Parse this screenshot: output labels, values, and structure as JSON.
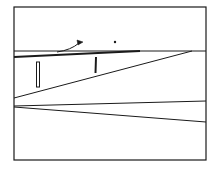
{
  "diagram": {
    "stroke_color": "#1a1a1a",
    "background": "#ffffff",
    "frame": {
      "x1": 14,
      "y1": 7,
      "x2": 206,
      "y2": 160
    },
    "lines": [
      {
        "name": "horizontal-reference-line",
        "x1": 14,
        "y1": 51,
        "x2": 206,
        "y2": 51,
        "w": 1
      },
      {
        "name": "upper-thick-line",
        "x1": 14,
        "y1": 57,
        "x2": 140,
        "y2": 51,
        "w": 1.8
      },
      {
        "name": "diagonal-line",
        "x1": 14,
        "y1": 98,
        "x2": 192,
        "y2": 51,
        "w": 1
      },
      {
        "name": "lower-line-a",
        "x1": 14,
        "y1": 106,
        "x2": 206,
        "y2": 101,
        "w": 1
      },
      {
        "name": "lower-line-b",
        "x1": 14,
        "y1": 107,
        "x2": 206,
        "y2": 122,
        "w": 1
      }
    ],
    "marks": {
      "double_bar": {
        "x": 38,
        "y1": 62,
        "y2": 87
      },
      "single_bar": {
        "x": 96,
        "y1": 57,
        "y2": 73
      },
      "arrow": {
        "from_x": 57,
        "from_y": 52,
        "to_x": 81,
        "to_y": 42
      },
      "dot": {
        "x": 115,
        "y": 42
      }
    }
  }
}
